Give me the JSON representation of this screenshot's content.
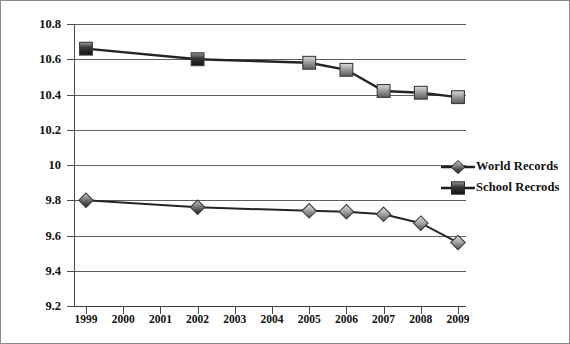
{
  "chart_data": {
    "type": "line",
    "title": "",
    "xlabel": "",
    "ylabel": "",
    "x": [
      1999,
      2000,
      2001,
      2002,
      2003,
      2004,
      2005,
      2006,
      2007,
      2008,
      2009
    ],
    "xtick_labels": [
      "1999",
      "2000",
      "2001",
      "2002",
      "2003",
      "2004",
      "2005",
      "2006",
      "2007",
      "2008",
      "2009"
    ],
    "ylim": [
      9.2,
      10.8
    ],
    "ytick_values": [
      9.2,
      9.4,
      9.6,
      9.8,
      10,
      10.2,
      10.4,
      10.6,
      10.8
    ],
    "ytick_labels": [
      "9.2",
      "9.4",
      "9.6",
      "9.8",
      "10",
      "10.2",
      "10.4",
      "10.6",
      "10.8"
    ],
    "grid": true,
    "legend_position": "right",
    "series": [
      {
        "name": "World Records",
        "marker": "diamond",
        "color": "#8c8c8c",
        "line_color": "#2a2a2a",
        "points": [
          {
            "x": 1999,
            "y": 9.8
          },
          {
            "x": 2002,
            "y": 9.76
          },
          {
            "x": 2005,
            "y": 9.74
          },
          {
            "x": 2006,
            "y": 9.735
          },
          {
            "x": 2007,
            "y": 9.72
          },
          {
            "x": 2008,
            "y": 9.67
          },
          {
            "x": 2009,
            "y": 9.56
          }
        ]
      },
      {
        "name": "School Recrods",
        "marker": "square",
        "color": "#8c8c8c",
        "line_color": "#2a2a2a",
        "points": [
          {
            "x": 1999,
            "y": 10.66
          },
          {
            "x": 2002,
            "y": 10.6
          },
          {
            "x": 2005,
            "y": 10.58
          },
          {
            "x": 2006,
            "y": 10.54
          },
          {
            "x": 2007,
            "y": 10.42
          },
          {
            "x": 2008,
            "y": 10.41
          },
          {
            "x": 2009,
            "y": 10.385
          }
        ]
      }
    ]
  },
  "legend": {
    "items": [
      {
        "label": "World Records",
        "marker": "diamond"
      },
      {
        "label": "School Recrods",
        "marker": "square"
      }
    ]
  },
  "colors": {
    "marker_fill_light": "#d4d4d4",
    "marker_fill_dark": "#6b6b6b",
    "marker_stroke": "#3c3c3c",
    "line": "#242424",
    "grid": "#5e5e5e",
    "axis": "#3a3a3a",
    "text": "#111111",
    "frame": "#8a8a8a",
    "background": "#ffffff"
  }
}
